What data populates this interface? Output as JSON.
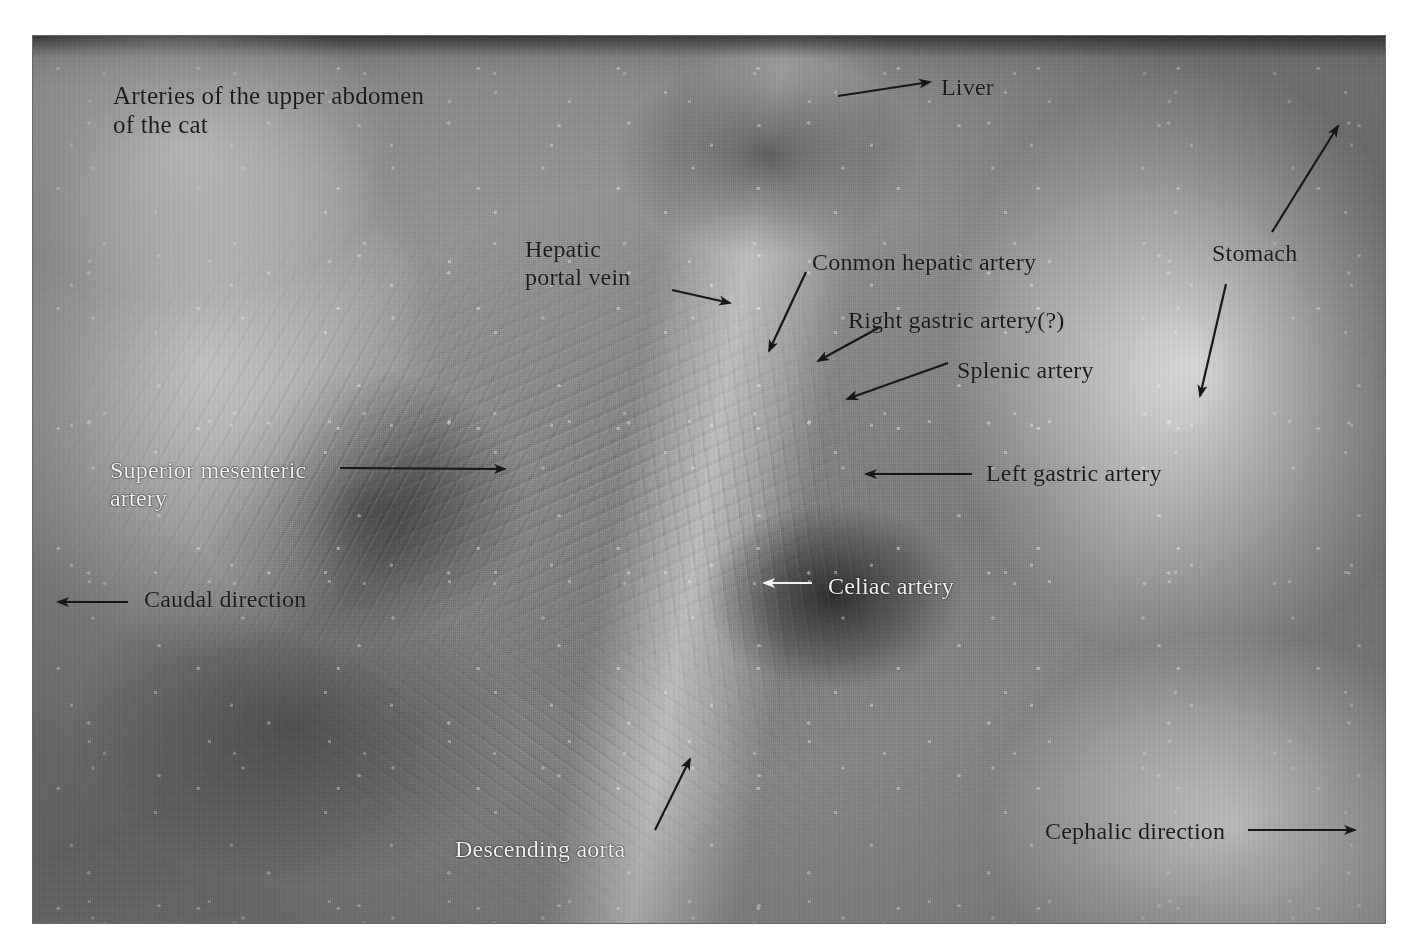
{
  "figure": {
    "title_line1": "Arteries of the upper abdomen",
    "title_line2": "of the cat",
    "medium": "black and white anatomical photograph",
    "frame_color": "#6a6a6a",
    "background_color": "#ffffff"
  },
  "labels": [
    {
      "id": "title",
      "text": "Arteries of the upper abdomen\nof the cat",
      "color": "#1a1a1a",
      "style": "dark",
      "x": 113,
      "y": 82,
      "font_size": 25,
      "has_arrow": false
    },
    {
      "id": "liver",
      "text": "Liver",
      "color": "#1a1a1a",
      "style": "dark",
      "x": 941,
      "y": 74,
      "font_size": 24,
      "has_arrow": true,
      "arrow_direction": "left"
    },
    {
      "id": "hepatic-portal-vein",
      "text": "Hepatic\nportal vein",
      "color": "#1a1a1a",
      "style": "dark",
      "x": 525,
      "y": 236,
      "font_size": 24,
      "has_arrow": true,
      "arrow_direction": "down-right"
    },
    {
      "id": "common-hepatic-artery",
      "text": "Conmon hepatic artery",
      "color": "#1a1a1a",
      "style": "dark",
      "x": 812,
      "y": 249,
      "font_size": 24,
      "has_arrow": true,
      "arrow_direction": "down-left"
    },
    {
      "id": "right-gastric-artery",
      "text": "Right gastric artery(?)",
      "color": "#1a1a1a",
      "style": "dark",
      "x": 848,
      "y": 307,
      "font_size": 24,
      "has_arrow": true,
      "arrow_direction": "down-left"
    },
    {
      "id": "splenic-artery",
      "text": "Splenic artery",
      "color": "#1a1a1a",
      "style": "dark",
      "x": 957,
      "y": 357,
      "font_size": 24,
      "has_arrow": true,
      "arrow_direction": "down-left"
    },
    {
      "id": "stomach",
      "text": "Stomach",
      "color": "#1a1a1a",
      "style": "dark",
      "x": 1212,
      "y": 240,
      "font_size": 24,
      "has_arrow": true,
      "arrow_direction": "double-diagonal"
    },
    {
      "id": "superior-mesenteric-artery",
      "text": "Superior mesenteric\nartery",
      "color": "#f4f4f4",
      "style": "light",
      "x": 110,
      "y": 457,
      "font_size": 24,
      "has_arrow": true,
      "arrow_direction": "right"
    },
    {
      "id": "left-gastric-artery",
      "text": "Left gastric artery",
      "color": "#1a1a1a",
      "style": "dark",
      "x": 986,
      "y": 460,
      "font_size": 24,
      "has_arrow": true,
      "arrow_direction": "left"
    },
    {
      "id": "caudal-direction",
      "text": "Caudal direction",
      "color": "#1a1a1a",
      "style": "dark",
      "x": 144,
      "y": 586,
      "font_size": 24,
      "has_arrow": true,
      "arrow_direction": "left"
    },
    {
      "id": "celiac-artery",
      "text": "Celiac artery",
      "color": "#f4f4f4",
      "style": "light",
      "x": 828,
      "y": 573,
      "font_size": 24,
      "has_arrow": true,
      "arrow_direction": "left"
    },
    {
      "id": "descending-aorta",
      "text": "Descending aorta",
      "color": "#f4f4f4",
      "style": "light",
      "x": 455,
      "y": 836,
      "font_size": 24,
      "has_arrow": true,
      "arrow_direction": "up-right"
    },
    {
      "id": "cephalic-direction",
      "text": "Cephalic direction",
      "color": "#1a1a1a",
      "style": "dark",
      "x": 1045,
      "y": 818,
      "font_size": 24,
      "has_arrow": true,
      "arrow_direction": "right"
    }
  ],
  "arrows": [
    {
      "id": "arrow-liver",
      "color": "#171717",
      "points": "930,82 838,96",
      "head": "start"
    },
    {
      "id": "arrow-hepatic-portal-vein",
      "color": "#171717",
      "points": "672,290 730,303",
      "head": "end"
    },
    {
      "id": "arrow-common-hepatic-artery",
      "color": "#171717",
      "points": "806,272 769,351",
      "head": "end"
    },
    {
      "id": "arrow-right-gastric-artery",
      "color": "#171717",
      "points": "880,327 818,361",
      "head": "end"
    },
    {
      "id": "arrow-splenic-artery",
      "color": "#171717",
      "points": "948,363 847,399",
      "head": "end"
    },
    {
      "id": "arrow-stomach-up",
      "color": "#171717",
      "points": "1272,232 1338,126",
      "head": "end"
    },
    {
      "id": "arrow-stomach-down",
      "color": "#171717",
      "points": "1226,284 1200,396",
      "head": "end"
    },
    {
      "id": "arrow-superior-mesenteric",
      "color": "#171717",
      "points": "340,468 505,469",
      "head": "end"
    },
    {
      "id": "arrow-left-gastric-artery",
      "color": "#171717",
      "points": "972,474 866,474",
      "head": "end"
    },
    {
      "id": "arrow-caudal-direction",
      "color": "#171717",
      "points": "128,602 58,602",
      "head": "end"
    },
    {
      "id": "arrow-celiac-artery",
      "color": "#f2f2f2",
      "points": "812,583 764,583",
      "head": "end"
    },
    {
      "id": "arrow-descending-aorta",
      "color": "#171717",
      "points": "655,830 690,759",
      "head": "end"
    },
    {
      "id": "arrow-cephalic-direction",
      "color": "#171717",
      "points": "1248,830 1355,830",
      "head": "end"
    }
  ]
}
